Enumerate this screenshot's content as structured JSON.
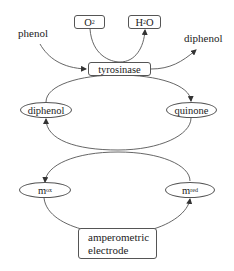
{
  "diagram": {
    "inputs": {
      "phenol": "phenol",
      "product_diphenol": "diphenol"
    },
    "cofactors": {
      "o2": {
        "main": "O",
        "sub": "2",
        "suffix": ""
      },
      "h2o": {
        "main": "H",
        "sub": "2",
        "suffix": "O"
      }
    },
    "enzyme": "tyrosinase",
    "cycle_top": {
      "left": "diphenol",
      "right": "quinone"
    },
    "cycle_bottom": {
      "left": {
        "main": "m",
        "sub": "ox"
      },
      "right": {
        "main": "m",
        "sub": "red"
      }
    },
    "electrode": {
      "line1": "amperometric",
      "line2": "electrode"
    },
    "edges": [
      {
        "from": "phenol",
        "to": "tyrosinase"
      },
      {
        "from": "O2",
        "to": "H2O",
        "via": "tyrosinase"
      },
      {
        "from": "tyrosinase",
        "to": "diphenol (product)"
      },
      {
        "from": "diphenol",
        "to": "quinone",
        "via": "tyrosinase"
      },
      {
        "from": "quinone",
        "to": "diphenol"
      },
      {
        "from": "m_red",
        "to": "m_ox"
      },
      {
        "from": "m_ox",
        "to": "m_red",
        "via": "amperometric electrode"
      }
    ],
    "colors": {
      "stroke": "#555555",
      "text": "#222222",
      "background": "#ffffff"
    }
  }
}
